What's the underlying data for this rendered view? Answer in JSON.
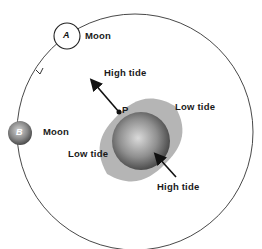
{
  "diagram": {
    "moons": [
      {
        "letter": "A",
        "label": "Moon"
      },
      {
        "letter": "B",
        "label": "Moon"
      }
    ],
    "earth_point": "P",
    "labels": {
      "high_tide_top": "High tide",
      "high_tide_bottom": "High tide",
      "low_tide_right": "Low tide",
      "low_tide_left": "Low tide"
    },
    "colors": {
      "orbit": "#333333",
      "tidal_bulge": "#b8b8b8",
      "earth_dark": "#4a4a4a",
      "earth_light": "#d8d8d8",
      "moon_b_dark": "#555555",
      "moon_b_light": "#cfcfcf"
    }
  }
}
